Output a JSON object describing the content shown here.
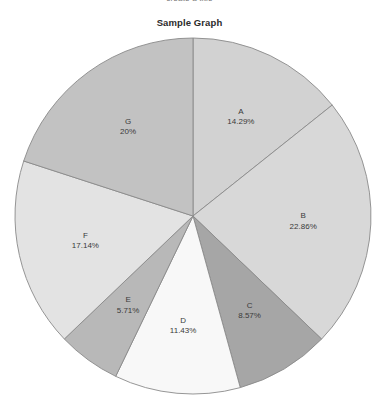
{
  "top_caption": "create a title",
  "title": "Sample Graph",
  "chart_data": {
    "type": "pie",
    "title": "Sample Graph",
    "xlabel": "",
    "ylabel": "",
    "legend": "none",
    "grid": false,
    "start_angle_deg": 0,
    "direction": "clockwise",
    "categories": [
      "A",
      "B",
      "C",
      "D",
      "E",
      "F",
      "G"
    ],
    "values": [
      14.29,
      22.86,
      8.57,
      11.43,
      5.71,
      17.14,
      20.0
    ],
    "value_unit": "%",
    "colors": [
      "#d2d2d2",
      "#d8d8d8",
      "#a6a6a6",
      "#f8f8f8",
      "#b8b8b8",
      "#e3e3e3",
      "#c2c2c2"
    ],
    "slices": [
      {
        "name": "A",
        "percent_label": "14.29%",
        "value": 14.29,
        "color": "#d2d2d2"
      },
      {
        "name": "B",
        "percent_label": "22.86%",
        "value": 22.86,
        "color": "#d8d8d8"
      },
      {
        "name": "C",
        "percent_label": "8.57%",
        "value": 8.57,
        "color": "#a6a6a6"
      },
      {
        "name": "D",
        "percent_label": "11.43%",
        "value": 11.43,
        "color": "#f8f8f8"
      },
      {
        "name": "E",
        "percent_label": "5.71%",
        "value": 5.71,
        "color": "#b8b8b8"
      },
      {
        "name": "F",
        "percent_label": "17.14%",
        "value": 17.14,
        "color": "#e3e3e3"
      },
      {
        "name": "G",
        "percent_label": "20%",
        "value": 20.0,
        "color": "#c2c2c2"
      }
    ]
  },
  "geometry": {
    "center_x": 193,
    "center_y": 216,
    "radius": 178,
    "label_radius_ratio": 0.62
  }
}
